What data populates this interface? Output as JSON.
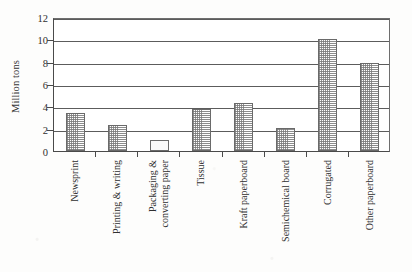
{
  "chart_data": {
    "type": "bar",
    "title": "",
    "subtitle": "",
    "xlabel": "",
    "ylabel": "Million tons",
    "ylim": [
      0,
      12
    ],
    "yticks": [
      0,
      2,
      4,
      6,
      8,
      10,
      12
    ],
    "ytick_labels": [
      "0",
      "2",
      "4",
      "6",
      "8",
      "10",
      "12"
    ],
    "grid": "horizontal",
    "legend": "none",
    "categories": [
      "Newsprint",
      "Printing & writing",
      "Packaging & converting paper",
      "Tissue",
      "Kraft paperboard",
      "Semichemical board",
      "Corrugated",
      "Other paperboard"
    ],
    "category_lines": [
      [
        "Newsprint"
      ],
      [
        "Printing & writing"
      ],
      [
        "Packaging &",
        "converting paper"
      ],
      [
        "Tissue"
      ],
      [
        "Kraft paperboard"
      ],
      [
        "Semichemical board"
      ],
      [
        "Corrugated"
      ],
      [
        "Other paperboard"
      ]
    ],
    "values": [
      3.4,
      2.3,
      1.0,
      3.8,
      4.3,
      2.1,
      10.0,
      7.9
    ],
    "units": "Million tons",
    "bar_fill": "fine dotted / stippled pattern",
    "bar_border_color": "#6a6a6a",
    "gridline_color": "#5c5c5c",
    "axis_color": "#4a4a4a",
    "background_color": "#fdfdfc",
    "annotations": []
  }
}
